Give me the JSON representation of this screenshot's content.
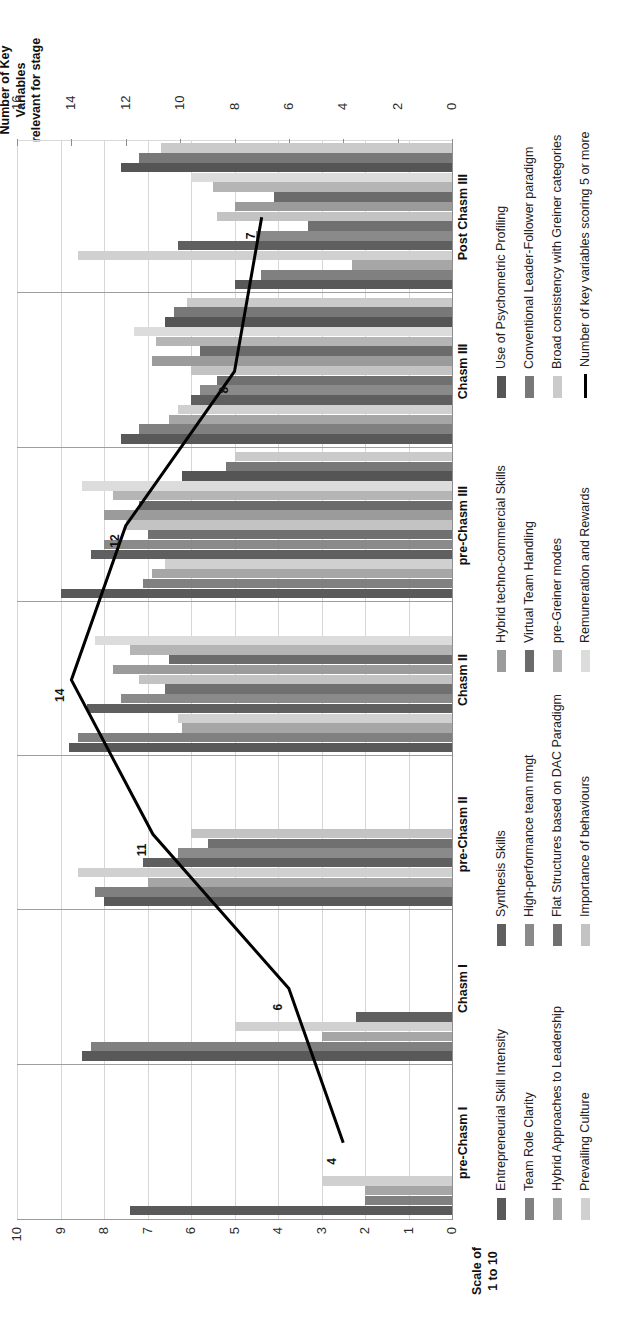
{
  "axes": {
    "primary": {
      "label_line1": "Scale of",
      "label_line2": "1 to 10",
      "ticks": [
        0,
        1,
        2,
        3,
        4,
        5,
        6,
        7,
        8,
        9,
        10
      ],
      "min": 0,
      "max": 10
    },
    "secondary": {
      "label_line1": "Number of Key",
      "label_line2": "Variables",
      "label_line3": "relevant for stage",
      "ticks": [
        0,
        2,
        4,
        6,
        8,
        10,
        12,
        14,
        16
      ],
      "min": 0,
      "max": 16
    }
  },
  "chart_data": {
    "type": "bar",
    "title": "",
    "xlabel": "",
    "ylabel": "Scale of 1 to 10",
    "y2label": "Number of Key Variables relevant for stage",
    "ylim": [
      0,
      10
    ],
    "y2lim": [
      0,
      16
    ],
    "grid": true,
    "legend": "bottom",
    "categories": [
      "pre-Chasm I",
      "Chasm I",
      "pre-Chasm II",
      "Chasm II",
      "pre-Chasm III",
      "Chasm III",
      "Post Chasm III"
    ],
    "series": [
      {
        "name": "Entrepreneurial Skill Intensity",
        "color": "#595959",
        "values": [
          7.4,
          8.5,
          8.0,
          8.8,
          9.0,
          7.6,
          5.0
        ]
      },
      {
        "name": "Team Role Clarity",
        "color": "#808080",
        "values": [
          2.0,
          8.3,
          8.2,
          8.6,
          7.1,
          7.2,
          4.4
        ]
      },
      {
        "name": "Hybrid Approaches to Leadership",
        "color": "#a6a6a6",
        "values": [
          2.0,
          3.0,
          7.0,
          6.2,
          6.9,
          6.5,
          2.3
        ]
      },
      {
        "name": "Prevailing Culture",
        "color": "#d0d0d0",
        "values": [
          3.0,
          5.0,
          8.6,
          6.3,
          6.6,
          6.3,
          8.6
        ]
      },
      {
        "name": "Synthesis Skills",
        "color": "#5f5f5f",
        "values": [
          0.0,
          2.2,
          7.1,
          8.4,
          8.3,
          6.0,
          6.3
        ]
      },
      {
        "name": "High-performance team mngt",
        "color": "#8a8a8a",
        "values": [
          0.0,
          0.0,
          6.3,
          7.6,
          8.0,
          5.8,
          4.5
        ]
      },
      {
        "name": "Flat Structures based on DAC Paradigm",
        "color": "#707070",
        "values": [
          0.0,
          0.0,
          5.6,
          6.6,
          7.0,
          5.4,
          3.3
        ]
      },
      {
        "name": "Importance of behaviours",
        "color": "#c3c3c3",
        "values": [
          0.0,
          0.0,
          6.0,
          7.2,
          7.5,
          6.0,
          5.4
        ]
      },
      {
        "name": "Hybrid techno-commercial Skills",
        "color": "#9b9b9b",
        "values": [
          0.0,
          0.0,
          0.0,
          7.8,
          8.0,
          6.9,
          5.0
        ]
      },
      {
        "name": "Virtual Team Handling",
        "color": "#6b6b6b",
        "values": [
          0.0,
          0.0,
          0.0,
          6.5,
          7.2,
          5.8,
          4.1
        ]
      },
      {
        "name": "pre-Greiner modes",
        "color": "#b5b5b5",
        "values": [
          0.0,
          0.0,
          0.0,
          7.4,
          7.8,
          6.8,
          5.5
        ]
      },
      {
        "name": "Remuneration and Rewards",
        "color": "#dcdcdc",
        "values": [
          0.0,
          0.0,
          0.0,
          8.2,
          8.5,
          7.3,
          6.0
        ]
      },
      {
        "name": "Use of Psychometric Profiling",
        "color": "#555555",
        "values": [
          0.0,
          0.0,
          0.0,
          0.0,
          6.2,
          6.6,
          7.6
        ]
      },
      {
        "name": "Conventional Leader-Follower paradigm",
        "color": "#787878",
        "values": [
          0.0,
          0.0,
          0.0,
          0.0,
          5.2,
          6.4,
          7.2
        ]
      },
      {
        "name": "Broad consistency with Greiner categories",
        "color": "#cacaca",
        "values": [
          0.0,
          0.0,
          0.0,
          0.0,
          5.0,
          6.1,
          6.7
        ]
      },
      {
        "name": "Number of key variables scoring 5 or more",
        "color": "#000000",
        "type": "line",
        "axis": "secondary",
        "values": [
          4,
          6,
          11,
          14,
          12,
          8,
          7
        ]
      }
    ],
    "line_point_labels": [
      "4",
      "6",
      "11",
      "14",
      "12",
      "8",
      "7"
    ]
  },
  "legend": {
    "columns": [
      [
        "Entrepreneurial Skill Intensity",
        "Team Role Clarity",
        "Hybrid Approaches to Leadership",
        "Prevailing Culture"
      ],
      [
        "Synthesis Skills",
        "High-performance team mngt",
        "Flat Structures based on DAC Paradigm",
        "Importance of behaviours"
      ],
      [
        "Hybrid techno-commercial Skills",
        "Virtual Team Handling",
        "pre-Greiner modes",
        "Remuneration and Rewards"
      ],
      [
        "Use of Psychometric Profiling",
        "Conventional Leader-Follower paradigm",
        "Broad consistency with Greiner categories",
        "Number of key variables scoring 5 or more"
      ]
    ]
  }
}
